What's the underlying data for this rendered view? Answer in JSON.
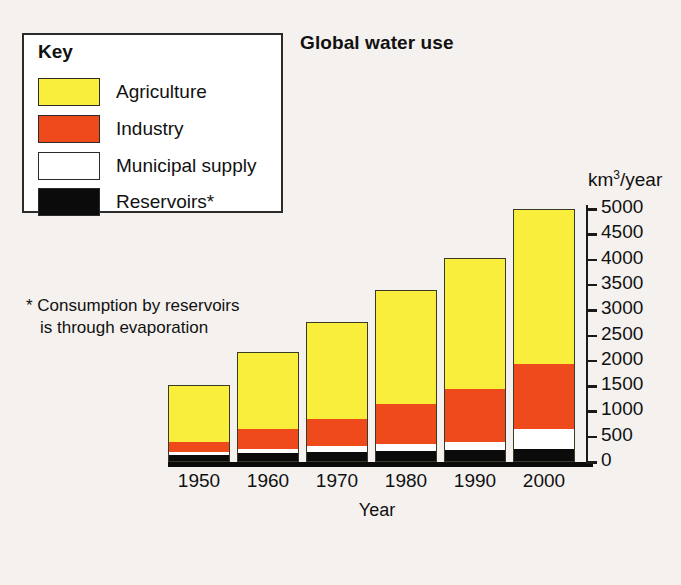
{
  "chart_data": {
    "type": "bar",
    "stacked": true,
    "title": "Global water use",
    "xlabel": "Year",
    "ylabel": "km3/year",
    "ylabel_html": "km<sup>3</sup>/year",
    "categories": [
      "1950",
      "1960",
      "1970",
      "1980",
      "1990",
      "2000"
    ],
    "ylim": [
      0,
      5000
    ],
    "yticks": [
      "0",
      "500",
      "1000",
      "1500",
      "2000",
      "2500",
      "3000",
      "3500",
      "4000",
      "4500",
      "5000"
    ],
    "ytick_values": [
      0,
      500,
      1000,
      1500,
      2000,
      2500,
      3000,
      3500,
      4000,
      4500,
      5000
    ],
    "grid": false,
    "legend_position": "top-left",
    "series": [
      {
        "name": "Reservoirs*",
        "color": "#0b0b0b",
        "values": [
          120,
          150,
          180,
          200,
          220,
          240
        ]
      },
      {
        "name": "Municipal supply",
        "color": "#ffffff",
        "values": [
          60,
          90,
          120,
          140,
          160,
          390
        ]
      },
      {
        "name": "Industry",
        "color": "#ee4a1c",
        "values": [
          195,
          390,
          530,
          790,
          1040,
          1290
        ]
      },
      {
        "name": "Agriculture",
        "color": "#faee3c",
        "values": [
          1145,
          1540,
          1940,
          2270,
          2610,
          3080
        ]
      }
    ],
    "totals": [
      1520,
      2170,
      2770,
      3400,
      4030,
      5000
    ],
    "cumulative_tops": {
      "reservoirs": [
        120,
        150,
        180,
        200,
        220,
        240
      ],
      "municipal": [
        180,
        240,
        300,
        340,
        380,
        630
      ],
      "industry": [
        375,
        630,
        830,
        1130,
        1420,
        1920
      ],
      "agriculture": [
        1520,
        2170,
        2770,
        3400,
        4030,
        5000
      ]
    },
    "annotations": [
      "* Consumption by reservoirs is through evaporation"
    ]
  },
  "legend": {
    "title": "Key",
    "items": [
      {
        "label": "Agriculture",
        "color": "#faee3c"
      },
      {
        "label": "Industry",
        "color": "#ee4a1c"
      },
      {
        "label": "Municipal supply",
        "color": "#ffffff"
      },
      {
        "label": "Reservoirs*",
        "color": "#0b0b0b"
      }
    ]
  },
  "footnote": {
    "line1": "* Consumption by reservoirs",
    "line2": "is through evaporation"
  },
  "colors": {
    "agriculture": "#faee3c",
    "industry": "#ee4a1c",
    "municipal": "#ffffff",
    "reservoirs": "#0b0b0b",
    "background": "#f5f1ef",
    "outline": "#2b2b2b"
  }
}
